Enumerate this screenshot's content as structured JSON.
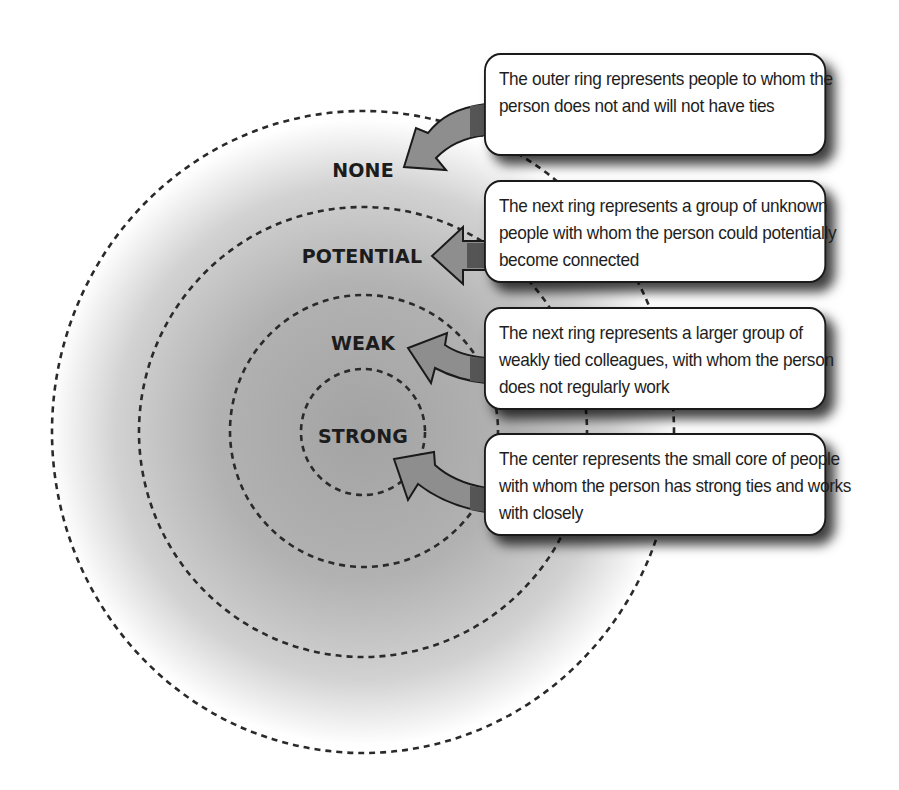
{
  "diagram": {
    "type": "concentric-rings",
    "colors": {
      "background": "#ffffff",
      "gradient_center": "#a3a3a3",
      "gradient_edge": "#ffffff",
      "ring_stroke": "#2a2a2a",
      "arrow_fill": "#8e8e8e",
      "arrow_band": "#555555",
      "arrow_stroke": "#1a1a1a",
      "callout_border": "#1a1a1a",
      "text": "#1e1e1e"
    },
    "rings": [
      {
        "id": "none",
        "label": "NONE",
        "radius": 320
      },
      {
        "id": "potential",
        "label": "POTENTIAL",
        "radius": 224
      },
      {
        "id": "weak",
        "label": "WEAK",
        "radius": 135
      },
      {
        "id": "strong",
        "label": "STRONG",
        "radius": 62
      }
    ],
    "callouts": [
      {
        "ring": "none",
        "text": "The outer ring represents people to whom the person does not and will not have ties"
      },
      {
        "ring": "potential",
        "text": "The next ring represents a group of unknown people with whom the person could potentially become connected"
      },
      {
        "ring": "weak",
        "text": "The next ring represents a larger group of weakly tied colleagues, with whom the person does not regularly work"
      },
      {
        "ring": "strong",
        "text": "The center represents the small core of people with whom the person has strong ties and works with closely"
      }
    ]
  }
}
